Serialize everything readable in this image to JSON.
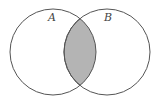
{
  "diagram": {
    "type": "venn",
    "sets": [
      {
        "id": "A",
        "label": "A"
      },
      {
        "id": "B",
        "label": "B"
      }
    ],
    "highlighted_region": "A ∩ B",
    "colors": {
      "outline": "#555555",
      "highlight_fill": "#b4b4b4",
      "background": "#ffffff"
    }
  }
}
